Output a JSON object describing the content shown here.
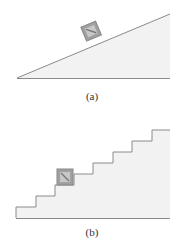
{
  "figure_a": {
    "label": "(a)",
    "description": "block on inclined plane"
  },
  "figure_b": {
    "label": "(b)",
    "description": "block on staircase"
  },
  "colors": {
    "fill": "#f2f2f2",
    "line": "#8a8a8a",
    "block": "#9a9a9a"
  }
}
